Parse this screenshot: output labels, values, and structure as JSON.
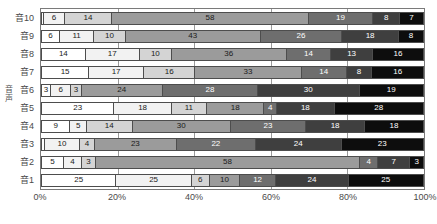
{
  "axis_group_label": "音声",
  "chart_data": {
    "type": "bar",
    "orientation": "horizontal",
    "stacked": "100%",
    "title": "",
    "xlabel": "",
    "ylabel": "",
    "xlim": [
      0,
      100
    ],
    "xticks": [
      "0%",
      "20%",
      "40%",
      "60%",
      "80%",
      "100%"
    ],
    "xtick_values": [
      0,
      20,
      40,
      60,
      80,
      100
    ],
    "grid": true,
    "legend": "none",
    "categories": [
      "音10",
      "音9",
      "音8",
      "音7",
      "音6",
      "音5",
      "音4",
      "音3",
      "音2",
      "音1"
    ],
    "series": [
      {
        "name": "s1",
        "color": "#ffffff",
        "values": [
          1,
          6,
          14,
          15,
          3,
          23,
          9,
          1,
          5,
          25
        ]
      },
      {
        "name": "s2",
        "color": "#f2f2f2",
        "values": [
          6,
          11,
          17,
          17,
          6,
          18,
          5,
          10,
          4,
          25
        ]
      },
      {
        "name": "s3",
        "color": "#d4d4d4",
        "values": [
          14,
          10,
          10,
          16,
          3,
          11,
          14,
          4,
          3,
          6
        ]
      },
      {
        "name": "s4",
        "color": "#9b9b9b",
        "values": [
          58,
          43,
          36,
          33,
          24,
          18,
          30,
          23,
          58,
          10
        ]
      },
      {
        "name": "s5",
        "color": "#6e6e6e",
        "values": [
          19,
          26,
          14,
          14,
          28,
          4,
          23,
          22,
          4,
          12
        ]
      },
      {
        "name": "s6",
        "color": "#3f3f3f",
        "values": [
          8,
          18,
          13,
          8,
          30,
          18,
          18,
          24,
          7,
          24
        ]
      },
      {
        "name": "s7",
        "color": "#0d0d0d",
        "values": [
          7,
          8,
          16,
          16,
          19,
          28,
          18,
          23,
          3,
          25
        ]
      }
    ],
    "bar_labels": {
      "音10": [
        "",
        "6",
        "14",
        "58",
        "19",
        "8",
        "7"
      ],
      "音9": [
        "6",
        "11",
        "10",
        "43",
        "26",
        "18",
        "8"
      ],
      "音8": [
        "14",
        "17",
        "10",
        "36",
        "14",
        "13",
        "16"
      ],
      "音7": [
        "15",
        "17",
        "16",
        "33",
        "14",
        "8",
        "16"
      ],
      "音6": [
        "3",
        "6",
        "3",
        "24",
        "28",
        "30",
        "19"
      ],
      "音5": [
        "23",
        "18",
        "11",
        "18",
        "4",
        "18",
        "28"
      ],
      "音4": [
        "9",
        "5",
        "14",
        "30",
        "23",
        "18",
        "18"
      ],
      "音3": [
        "",
        "10",
        "4",
        "23",
        "22",
        "24",
        "23"
      ],
      "音2": [
        "5",
        "4",
        "3",
        "58",
        "4",
        "7",
        "3"
      ],
      "音1": [
        "25",
        "25",
        "6",
        "10",
        "12",
        "24",
        "25"
      ]
    }
  }
}
